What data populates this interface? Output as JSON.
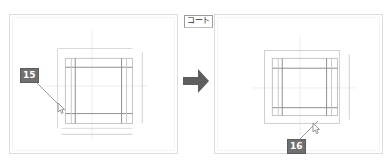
{
  "page": {
    "background_color": "#ffffff",
    "width": 391,
    "height": 164
  },
  "tag": {
    "text": "コート",
    "border_color": "#9a9a9a",
    "text_color": "#2b2b2b"
  },
  "arrow": {
    "name": "right-arrow-icon",
    "color": "#5e5e5e",
    "direction": "right"
  },
  "panels": [
    {
      "id": "before",
      "name": "before-panel",
      "border_color": "#dcdcdc",
      "background_color": "#ffffff",
      "callout": {
        "label": "15",
        "badge_color": "#6f6f6f",
        "text_color": "#ffffff"
      },
      "cursor": {
        "name": "mouse-cursor-icon",
        "color": "#8a8a8a"
      }
    },
    {
      "id": "after",
      "name": "after-panel",
      "border_color": "#dcdcdc",
      "background_color": "#ffffff",
      "callout": {
        "label": "16",
        "badge_color": "#6f6f6f",
        "text_color": "#ffffff"
      },
      "cursor": {
        "name": "mouse-cursor-icon",
        "color": "#8a8a8a"
      }
    }
  ],
  "drawing": {
    "name": "technical-line-drawing",
    "stroke_dark": "#8e8e8e",
    "stroke_mid": "#b9b9b9",
    "stroke_light": "#dadada",
    "stroke_faint": "#ededed"
  }
}
